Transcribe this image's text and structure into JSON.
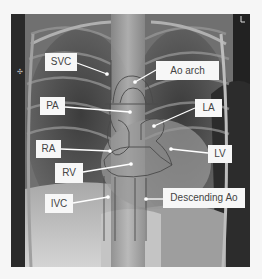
{
  "figure": {
    "background_color": "#f6f6f6",
    "outline_color": "#4a4a4a",
    "label_bg": "#f7f7f7",
    "label_text_color": "#444444",
    "pointer_color": "#ffffff"
  },
  "labels": [
    {
      "id": "svc",
      "text": "SVC"
    },
    {
      "id": "ao_arch",
      "text": "Ao arch"
    },
    {
      "id": "pa",
      "text": "PA"
    },
    {
      "id": "la",
      "text": "LA"
    },
    {
      "id": "ra",
      "text": "RA"
    },
    {
      "id": "lv",
      "text": "LV"
    },
    {
      "id": "rv",
      "text": "RV"
    },
    {
      "id": "ivc",
      "text": "IVC"
    },
    {
      "id": "desc_ao",
      "text": "Descending Ao"
    }
  ]
}
